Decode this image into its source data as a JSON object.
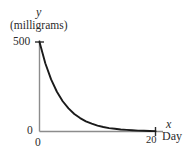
{
  "chart_data": {
    "type": "line",
    "title": "",
    "xlabel": "x",
    "xunit": "Day",
    "ylabel": "y",
    "yunit": "(milligrams)",
    "xlim": [
      0,
      20
    ],
    "ylim": [
      0,
      500
    ],
    "xticks": [
      0,
      20
    ],
    "xtick_labels": [
      "0",
      "20"
    ],
    "yticks": [
      0,
      500
    ],
    "ytick_labels": [
      "0",
      "500"
    ],
    "grid": false,
    "legend": "none",
    "series": [
      {
        "name": "exponential decay",
        "x": [
          0,
          1,
          2,
          3,
          4,
          5,
          6,
          7,
          8,
          9,
          10,
          11,
          12,
          13,
          14,
          15,
          16,
          17,
          18,
          19,
          20
        ],
        "y": [
          500,
          381,
          291,
          222,
          169,
          129,
          98,
          75,
          57,
          44,
          33,
          25,
          19,
          15,
          11,
          9,
          7,
          5,
          4,
          3,
          2
        ]
      }
    ],
    "annotations": []
  },
  "axes": {
    "y_axis_label": "y",
    "y_axis_unit": "(milligrams)",
    "y_tick_top": "500",
    "y_tick_bottom": "0",
    "x_tick_left": "0",
    "x_tick_right": "20",
    "x_axis_label": "x",
    "x_axis_unit": "Day"
  },
  "colors": {
    "curve": "#1a1a1a",
    "axis": "#8c8c8c",
    "text": "#2b2b2b",
    "background": "#ffffff"
  }
}
